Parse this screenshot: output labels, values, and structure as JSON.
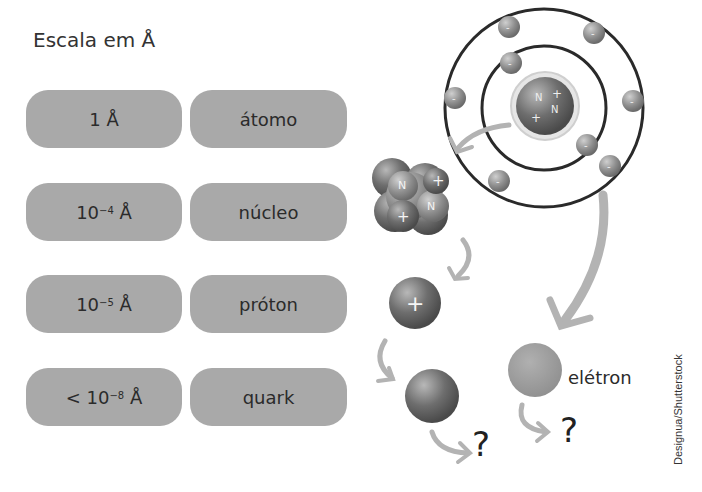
{
  "title": "Escala em Å",
  "scale_rows": [
    {
      "size": "1 Å",
      "size_base": "1",
      "size_exp": "",
      "size_prefix": "",
      "particle": "átomo"
    },
    {
      "size": "10⁻⁴ Å",
      "size_base": "10",
      "size_exp": "−4",
      "size_prefix": "",
      "particle": "núcleo"
    },
    {
      "size": "10⁻⁵ Å",
      "size_base": "10",
      "size_exp": "−5",
      "size_prefix": "",
      "particle": "próton"
    },
    {
      "size": "< 10⁻⁸ Å",
      "size_base": "10",
      "size_exp": "−8",
      "size_prefix": "< ",
      "particle": "quark"
    }
  ],
  "unit": "Å",
  "diagram": {
    "atom_electron_symbol": "-",
    "nucleus_labels": [
      "N",
      "+",
      "N",
      "+"
    ],
    "proton_symbol": "+",
    "electron_label": "elétron",
    "unknown_symbol": "?"
  },
  "credit": "Designua/Shutterstock",
  "colors": {
    "pill": "#a9a9a9",
    "arrow": "#b3b3b3",
    "orbit": "#2a2a2a",
    "particle_dark": "#6a6a6a",
    "particle_light": "#9a9a9a"
  }
}
